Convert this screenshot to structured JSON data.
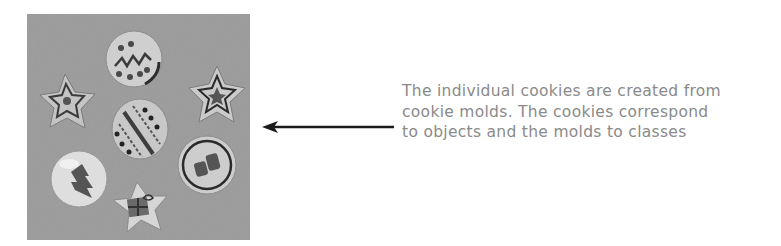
{
  "figure": {
    "photo": {
      "subject": "decorated cookies",
      "icon": "cookies-photo",
      "background_color": "#9b9b9b"
    },
    "arrow": {
      "direction": "left",
      "color": "#1a1a1a"
    },
    "caption": {
      "lines": [
        "The individual cookies are created from",
        "cookie molds. The cookies correspond",
        "to objects and the molds to classes"
      ],
      "color": "#8a8a8a"
    }
  }
}
